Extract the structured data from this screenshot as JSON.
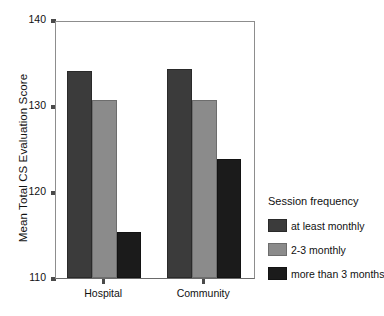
{
  "chart_data": {
    "type": "bar",
    "title": "",
    "xlabel": "",
    "ylabel": "Mean Total CS Evaluation Score",
    "categories": [
      "Hospital",
      "Community"
    ],
    "ylim": [
      110,
      140
    ],
    "yticks": [
      110,
      120,
      130,
      140
    ],
    "ytick_labels": [
      "110",
      "120",
      "130",
      "140"
    ],
    "grid": false,
    "legend_position": "right",
    "legend_title": "Session frequency",
    "series": [
      {
        "name": "at least monthly",
        "color": "#3b3b3b",
        "values": [
          134.1,
          134.3
        ]
      },
      {
        "name": "2-3 monthly",
        "color": "#8b8b8b",
        "values": [
          130.7,
          130.7
        ]
      },
      {
        "name": "more than 3 months",
        "color": "#1b1b1b",
        "values": [
          115.3,
          123.8
        ]
      }
    ]
  }
}
